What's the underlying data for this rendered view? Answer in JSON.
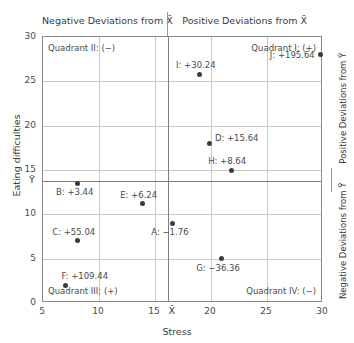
{
  "chart_data": {
    "type": "scatter",
    "title": "",
    "xlabel": "Stress",
    "ylabel": "Eating difficulties",
    "xlim": [
      5,
      30
    ],
    "ylim": [
      0,
      30
    ],
    "xticks": [
      5,
      10,
      15,
      20,
      25,
      30
    ],
    "yticks": [
      0,
      5,
      10,
      15,
      20,
      25,
      30
    ],
    "grid": true,
    "legend": "none",
    "x_mean": 16.2,
    "y_mean": 13.8,
    "x_mean_tick_label": "X̄",
    "y_mean_tick_label": "Ȳ",
    "points": [
      {
        "id": "A",
        "x": 16.6,
        "y": 9.0,
        "label": "A: −1.76",
        "value": -1.76,
        "label_pos": "below-left"
      },
      {
        "id": "B",
        "x": 8.1,
        "y": 13.5,
        "label": "B: +3.44",
        "value": 3.44,
        "label_pos": "below-left"
      },
      {
        "id": "C",
        "x": 8.1,
        "y": 7.0,
        "label": "C: +55.04",
        "value": 55.04,
        "label_pos": "above-left"
      },
      {
        "id": "D",
        "x": 19.9,
        "y": 18.0,
        "label": "D: +15.64",
        "value": 15.64,
        "label_pos": "right"
      },
      {
        "id": "E",
        "x": 13.9,
        "y": 11.2,
        "label": "E: +6.24",
        "value": 6.24,
        "label_pos": "above-left"
      },
      {
        "id": "F",
        "x": 7.0,
        "y": 2.0,
        "label": "F: +109.44",
        "value": 109.44,
        "label_pos": "above-right"
      },
      {
        "id": "G",
        "x": 20.9,
        "y": 5.0,
        "label": "G: −36.36",
        "value": -36.36,
        "label_pos": "below-left"
      },
      {
        "id": "H",
        "x": 21.8,
        "y": 15.0,
        "label": "H: +8.64",
        "value": 8.64,
        "label_pos": "above-left"
      },
      {
        "id": "I",
        "x": 19.0,
        "y": 25.8,
        "label": "I: +30.24",
        "value": 30.24,
        "label_pos": "above-left"
      },
      {
        "id": "J",
        "x": 29.8,
        "y": 28.0,
        "label": "J: +195.64",
        "value": 195.64,
        "label_pos": "left"
      }
    ],
    "annotations": {
      "top_left": "Negative Deviations from X̄",
      "top_right": "Positive Deviations from X̄",
      "right_top": "Positive Deviations from Ȳ",
      "right_bottom": "Negative Deviations from Ȳ",
      "quadrant_1": "Quadrant I: (+)",
      "quadrant_2": "Quadrant II: (−)",
      "quadrant_3": "Quadrant III: (+)",
      "quadrant_4": "Quadrant IV: (−)"
    }
  },
  "axes": {
    "x_tick_labels": [
      "5",
      "10",
      "15",
      "20",
      "25",
      "30"
    ],
    "y_tick_labels": [
      "0",
      "5",
      "10",
      "15",
      "20",
      "25",
      "30"
    ],
    "x_title": "Stress",
    "y_title": "Eating difficulties"
  },
  "colors": {
    "point": "#3b3b3b",
    "grid": "#c9c9c9",
    "frame": "#8a8a8a",
    "mean_line": "#7d7d7d",
    "text": "#3a3a3a"
  }
}
